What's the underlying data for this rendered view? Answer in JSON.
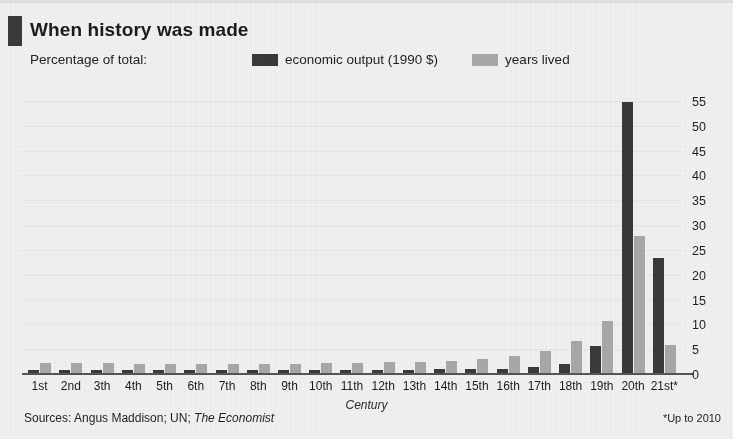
{
  "header": {
    "title": "When history was made",
    "subtitle": "Percentage of total:",
    "brand_mark_color": "#3b3b3b"
  },
  "legend": {
    "items": [
      {
        "label": "economic output (1990 $)",
        "color": "#3a3a3a",
        "key": "economic_output"
      },
      {
        "label": "years lived",
        "color": "#a9a9a9",
        "key": "years_lived"
      }
    ]
  },
  "axis": {
    "x_title": "Century",
    "y_ticks": [
      "0",
      "5",
      "10",
      "15",
      "20",
      "25",
      "30",
      "35",
      "40",
      "45",
      "50",
      "55"
    ]
  },
  "footer": {
    "sources_prefix": "Sources: Angus Maddison; UN; ",
    "sources_italic": "The Economist",
    "footnote": "*Up to 2010"
  },
  "chart_data": {
    "type": "bar",
    "title": "When history was made",
    "subtitle": "Percentage of total:",
    "xlabel": "Century",
    "ylabel": "",
    "ylim": [
      0,
      57
    ],
    "yticks": [
      0,
      5,
      10,
      15,
      20,
      25,
      30,
      35,
      40,
      45,
      50,
      55
    ],
    "grid": true,
    "legend_position": "top",
    "annotations": [
      "*Up to 2010"
    ],
    "categories": [
      "1st",
      "2nd",
      "3th",
      "4th",
      "5th",
      "6th",
      "7th",
      "8th",
      "9th",
      "10th",
      "11th",
      "12th",
      "13th",
      "14th",
      "15th",
      "16th",
      "17th",
      "18th",
      "19th",
      "20th",
      "21st*"
    ],
    "series": [
      {
        "name": "economic output (1990 $)",
        "color": "#3a3a3a",
        "values": [
          1.0,
          1.0,
          1.0,
          1.0,
          1.0,
          1.0,
          1.0,
          1.0,
          1.0,
          1.0,
          1.0,
          1.0,
          1.0,
          1.2,
          1.2,
          1.3,
          1.6,
          2.2,
          5.8,
          55.0,
          23.5
        ]
      },
      {
        "name": "years lived",
        "color": "#a9a9a9",
        "values": [
          2.4,
          2.4,
          2.4,
          2.2,
          2.2,
          2.2,
          2.2,
          2.2,
          2.2,
          2.4,
          2.5,
          2.6,
          2.6,
          2.8,
          3.2,
          3.8,
          4.8,
          6.8,
          10.8,
          28.0,
          6.0
        ]
      }
    ]
  }
}
